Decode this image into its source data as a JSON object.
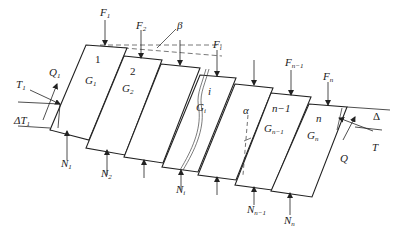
{
  "diagram": {
    "type": "slice-method-force-diagram",
    "slices": [
      {
        "id": "1",
        "number_label": "1",
        "weight_label": "G",
        "weight_sub": "1",
        "top_force": "F",
        "top_force_sub": "1",
        "bottom_force": "N",
        "bottom_force_sub": "1"
      },
      {
        "id": "2",
        "number_label": "2",
        "weight_label": "G",
        "weight_sub": "2",
        "top_force": "F",
        "top_force_sub": "2",
        "bottom_force": "N",
        "bottom_force_sub": "2"
      },
      {
        "id": "3",
        "number_label": "",
        "weight_label": "",
        "weight_sub": "",
        "top_force": "",
        "top_force_sub": "",
        "bottom_force": "",
        "bottom_force_sub": ""
      },
      {
        "id": "i",
        "number_label": "i",
        "weight_label": "G",
        "weight_sub": "i",
        "top_force": "F",
        "top_force_sub": "i",
        "bottom_force": "N",
        "bottom_force_sub": "i"
      },
      {
        "id": "alpha",
        "number_label": "",
        "weight_label": "",
        "weight_sub": "",
        "top_force": "",
        "top_force_sub": "",
        "bottom_force": "",
        "bottom_force_sub": "",
        "angle_label": "α"
      },
      {
        "id": "n-1",
        "number_label": "n−1",
        "weight_label": "G",
        "weight_sub": "n−1",
        "top_force": "F",
        "top_force_sub": "n−1",
        "bottom_force": "N",
        "bottom_force_sub": "n−1"
      },
      {
        "id": "n",
        "number_label": "n",
        "weight_label": "G",
        "weight_sub": "n",
        "top_force": "F",
        "top_force_sub": "n",
        "bottom_force": "N",
        "bottom_force_sub": "n"
      }
    ],
    "angle_beta_label": "β",
    "left_end": {
      "Q_label": "Q",
      "Q_sub": "1",
      "T_label": "T",
      "T_sub": "1",
      "delta_label": "ΔT",
      "delta_sub": "1"
    },
    "right_end": {
      "Q_label": "Q",
      "T_label": "T",
      "delta_label": "Δ"
    },
    "colors": {
      "line": "#222222",
      "dashed": "#555555",
      "background": "#ffffff"
    }
  }
}
